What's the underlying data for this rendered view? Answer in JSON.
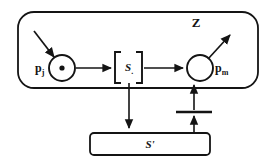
{
  "diagram": {
    "title": "Z",
    "module_label": "Z",
    "nodes": {
      "input_place": {
        "id": "p_j",
        "base": "p",
        "subscript": "j",
        "type": "place",
        "marking": 1,
        "token_symbol": "•",
        "cx": 62,
        "cy": 68,
        "r": 13
      },
      "transition_box": {
        "id": "S_c",
        "base": "S",
        "subscript": ".",
        "type": "bracketed-subnet",
        "open_bracket": "[",
        "close_bracket": "]",
        "cx": 128,
        "cy": 67
      },
      "output_place": {
        "id": "p_m",
        "base": "p",
        "subscript": "m",
        "type": "place",
        "marking": 0,
        "cx": 200,
        "cy": 68,
        "r": 13
      },
      "refinement_bar": {
        "id": "S'",
        "label": "S'",
        "type": "subnet-bar",
        "x": 90,
        "y": 133,
        "width": 120,
        "height": 22
      },
      "sync_transition": {
        "id": "sync-bar",
        "type": "transition-bar",
        "x1": 176,
        "x2": 212,
        "y": 112
      }
    },
    "arcs": [
      {
        "name": "external-input-arc",
        "from": "external",
        "to": "p_j",
        "style": "diagonal"
      },
      {
        "name": "pj-to-sbox-arc",
        "from": "p_j",
        "to": "S_c",
        "style": "horizontal"
      },
      {
        "name": "sbox-to-pm-arc",
        "from": "S_c",
        "to": "p_m",
        "style": "horizontal"
      },
      {
        "name": "pm-external-output-arc",
        "from": "p_m",
        "to": "external",
        "style": "diagonal"
      },
      {
        "name": "sbox-to-sprime-arc",
        "from": "S_c",
        "to": "S'",
        "style": "vertical-down"
      },
      {
        "name": "sprime-to-sync-arc",
        "from": "S'",
        "to": "sync-bar",
        "style": "vertical-up"
      },
      {
        "name": "sync-to-pm-arc",
        "from": "sync-bar",
        "to": "p_m",
        "style": "vertical-up"
      }
    ],
    "module_boundary": {
      "name": "module-z-boundary",
      "x": 18,
      "y": 12,
      "width": 240,
      "height": 76,
      "corner_radius": 16
    },
    "colors": {
      "stroke": "#141414",
      "fill": "#ffffff",
      "background": "#ffffff",
      "text": "#141414"
    }
  }
}
